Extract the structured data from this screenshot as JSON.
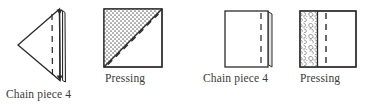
{
  "figure": {
    "width": 379,
    "height": 110,
    "background_color": "#ffffff",
    "line_color": "#2b2b2b",
    "fill_color": "#ffffff",
    "stipple_color": "#7a7a7a",
    "texture_color": "#8c8c8c"
  },
  "steps": [
    {
      "id": "step-1",
      "caption": "Chain piece 4",
      "shape": "left-pointing-triangle",
      "markings": [
        "vertical-dashed-stitch-line",
        "folded-edge-flap"
      ]
    },
    {
      "id": "step-2",
      "caption": "Pressing",
      "shape": "square",
      "markings": [
        "stippled-upper-left-triangle",
        "solid-diagonal-seam",
        "dashed-diagonal-fold-line"
      ]
    },
    {
      "id": "step-3",
      "caption": "Chain piece 4",
      "shape": "rectangle",
      "markings": [
        "vertical-dashed-stitch-line",
        "folded-edge-flap"
      ]
    },
    {
      "id": "step-4",
      "caption": "Pressing",
      "shape": "rectangle",
      "markings": [
        "textured-left-band",
        "solid-vertical-seam",
        "vertical-dashed-fold-line"
      ]
    }
  ]
}
